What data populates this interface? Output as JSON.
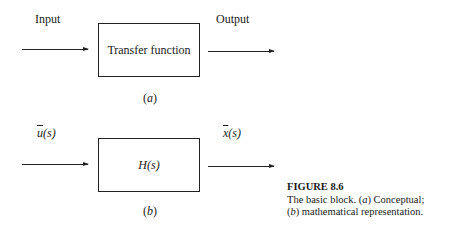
{
  "figure": {
    "number_label": "FIGURE 8.6",
    "caption_line1_prefix": "The basic block. (",
    "caption_line1_a": "a",
    "caption_line1_suffix": ") Conceptual;",
    "caption_line2_prefix": "(",
    "caption_line2_b": "b",
    "caption_line2_suffix": ") mathematical representation."
  },
  "panel_a": {
    "input_label": "Input",
    "output_label": "Output",
    "block_label": "Transfer function",
    "sublabel_open": "(",
    "sublabel_letter": "a",
    "sublabel_close": ")"
  },
  "panel_b": {
    "input_var": "u",
    "input_arg": "(s)",
    "output_var": "x",
    "output_arg": "(s)",
    "block_label": "H(s)",
    "sublabel_open": "(",
    "sublabel_letter": "b",
    "sublabel_close": ")"
  }
}
